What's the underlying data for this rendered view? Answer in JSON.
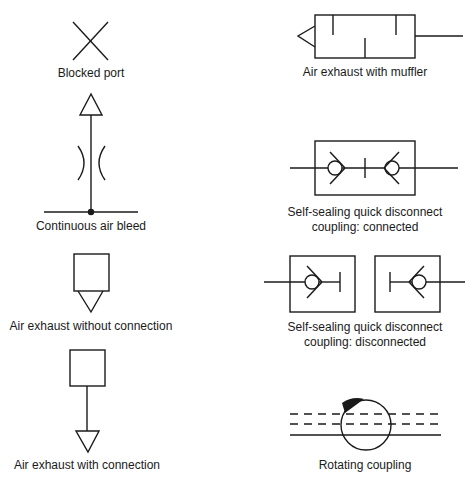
{
  "diagram": {
    "colors": {
      "stroke": "#1a1a1a",
      "background": "#ffffff"
    },
    "symbols": [
      {
        "id": "blocked-port",
        "label": "Blocked port"
      },
      {
        "id": "continuous-air-bleed",
        "label": "Continuous air bleed"
      },
      {
        "id": "air-exhaust-without-connection",
        "label": "Air exhaust without connection"
      },
      {
        "id": "air-exhaust-with-connection",
        "label": "Air exhaust with connection"
      },
      {
        "id": "air-exhaust-with-muffler",
        "label": "Air exhaust with muffler"
      },
      {
        "id": "quick-disconnect-connected",
        "label_line1": "Self-sealing quick disconnect",
        "label_line2": "coupling: connected"
      },
      {
        "id": "quick-disconnect-disconnected",
        "label_line1": "Self-sealing quick disconnect",
        "label_line2": "coupling: disconnected"
      },
      {
        "id": "rotating-coupling",
        "label": "Rotating coupling"
      }
    ]
  }
}
